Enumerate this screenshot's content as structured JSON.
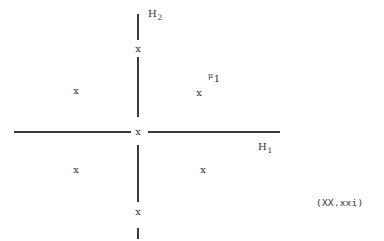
{
  "figure": {
    "background_color": "#ffffff",
    "ink_color": "#333333",
    "equation_number": "(XX.xxi)"
  },
  "axes": {
    "vertical": {
      "label": "H",
      "label_subscript": "2",
      "style": "dashed",
      "center_x": 137,
      "top_y": 14,
      "bottom_y": 238
    },
    "horizontal": {
      "label": "H",
      "label_subscript": "1",
      "style": "solid",
      "center_y": 131,
      "left_x": 14,
      "right_x": 280
    }
  },
  "vertical_segments": [
    {
      "x": 137,
      "y": 14,
      "height": 26
    },
    {
      "x": 137,
      "y": 57,
      "height": 60
    },
    {
      "x": 137,
      "y": 145,
      "height": 57
    },
    {
      "x": 137,
      "y": 228,
      "height": 11
    }
  ],
  "horizontal_segments": [
    {
      "x": 14,
      "y": 131,
      "width": 117
    },
    {
      "x": 148,
      "y": 131,
      "width": 132
    }
  ],
  "markers": [
    {
      "name": "marker-axis-upper",
      "char": "x",
      "x": 138,
      "y": 49
    },
    {
      "name": "marker-quadrant-upper-left",
      "char": "x",
      "x": 76,
      "y": 91
    },
    {
      "name": "marker-quadrant-upper-right",
      "char": "x",
      "x": 199,
      "y": 93
    },
    {
      "name": "marker-origin",
      "char": "x",
      "x": 138,
      "y": 132
    },
    {
      "name": "marker-quadrant-lower-left",
      "char": "x",
      "x": 76,
      "y": 170
    },
    {
      "name": "marker-quadrant-lower-right",
      "char": "x",
      "x": 203,
      "y": 170
    },
    {
      "name": "marker-axis-lower",
      "char": "x",
      "x": 138,
      "y": 212
    }
  ],
  "labels": {
    "h2": {
      "base": "H",
      "sub": "2",
      "x": 148,
      "y": 8
    },
    "h1": {
      "base": "H",
      "sub": "1",
      "x": 258,
      "y": 141
    },
    "mu1": {
      "base": "μ",
      "sub": "1",
      "x": 208,
      "y": 73
    }
  }
}
